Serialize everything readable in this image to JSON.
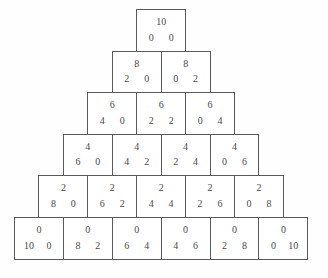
{
  "figure": {
    "type": "triangular-lattice-diagram",
    "total": 10,
    "rows": 6,
    "geometry": {
      "cell_width": 49.9,
      "cell_height": 42.6,
      "top_y": 9,
      "bottom_y": 264,
      "left_edge_bottom": 14,
      "right_edge_bottom": 313
    },
    "colors": {
      "background": "#ffffff",
      "border": "#5a5a5a",
      "text": "#4a4a4a"
    }
  },
  "chart_data": {
    "type": "table",
    "title": "",
    "xlabel": "",
    "ylabel": "",
    "rows": [
      {
        "index": 1,
        "cells": [
          {
            "top": "10",
            "left": "0",
            "right": "0"
          }
        ]
      },
      {
        "index": 2,
        "cells": [
          {
            "top": "8",
            "left": "2",
            "right": "0"
          },
          {
            "top": "8",
            "left": "0",
            "right": "2"
          }
        ]
      },
      {
        "index": 3,
        "cells": [
          {
            "top": "6",
            "left": "4",
            "right": "0"
          },
          {
            "top": "6",
            "left": "2",
            "right": "2"
          },
          {
            "top": "6",
            "left": "0",
            "right": "4"
          }
        ]
      },
      {
        "index": 4,
        "cells": [
          {
            "top": "4",
            "left": "6",
            "right": "0"
          },
          {
            "top": "4",
            "left": "4",
            "right": "2"
          },
          {
            "top": "4",
            "left": "2",
            "right": "4"
          },
          {
            "top": "4",
            "left": "0",
            "right": "6"
          }
        ]
      },
      {
        "index": 5,
        "cells": [
          {
            "top": "2",
            "left": "8",
            "right": "0"
          },
          {
            "top": "2",
            "left": "6",
            "right": "2"
          },
          {
            "top": "2",
            "left": "4",
            "right": "4"
          },
          {
            "top": "2",
            "left": "2",
            "right": "6"
          },
          {
            "top": "2",
            "left": "0",
            "right": "8"
          }
        ]
      },
      {
        "index": 6,
        "cells": [
          {
            "top": "0",
            "left": "10",
            "right": "0"
          },
          {
            "top": "0",
            "left": "8",
            "right": "2"
          },
          {
            "top": "0",
            "left": "6",
            "right": "4"
          },
          {
            "top": "0",
            "left": "4",
            "right": "6"
          },
          {
            "top": "0",
            "left": "2",
            "right": "8"
          },
          {
            "top": "0",
            "left": "0",
            "right": "10"
          }
        ]
      }
    ]
  }
}
